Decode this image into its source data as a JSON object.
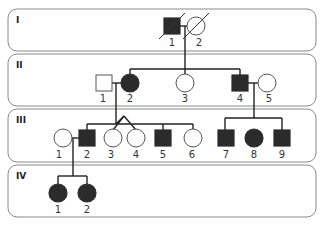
{
  "colors": {
    "affected": "#2b2b2b",
    "unaffected": "#ffffff",
    "line": "#222222",
    "band_border": "#8a8a8a"
  },
  "generations": [
    {
      "label": "I",
      "individuals": [
        {
          "id": "1",
          "sex": "male",
          "affected": true,
          "deceased": true
        },
        {
          "id": "2",
          "sex": "female",
          "affected": false,
          "deceased": true
        }
      ]
    },
    {
      "label": "II",
      "individuals": [
        {
          "id": "1",
          "sex": "male",
          "affected": false
        },
        {
          "id": "2",
          "sex": "female",
          "affected": true
        },
        {
          "id": "3",
          "sex": "female",
          "affected": false
        },
        {
          "id": "4",
          "sex": "male",
          "affected": true
        },
        {
          "id": "5",
          "sex": "female",
          "affected": false
        }
      ]
    },
    {
      "label": "III",
      "individuals": [
        {
          "id": "1",
          "sex": "female",
          "affected": false
        },
        {
          "id": "2",
          "sex": "male",
          "affected": true
        },
        {
          "id": "3",
          "sex": "female",
          "affected": false,
          "twin_with": "4"
        },
        {
          "id": "4",
          "sex": "female",
          "affected": false,
          "twin_with": "3"
        },
        {
          "id": "5",
          "sex": "male",
          "affected": true
        },
        {
          "id": "6",
          "sex": "female",
          "affected": false
        },
        {
          "id": "7",
          "sex": "male",
          "affected": true
        },
        {
          "id": "8",
          "sex": "female",
          "affected": true
        },
        {
          "id": "9",
          "sex": "male",
          "affected": true
        }
      ]
    },
    {
      "label": "IV",
      "individuals": [
        {
          "id": "1",
          "sex": "female",
          "affected": true
        },
        {
          "id": "2",
          "sex": "female",
          "affected": true
        }
      ]
    }
  ]
}
